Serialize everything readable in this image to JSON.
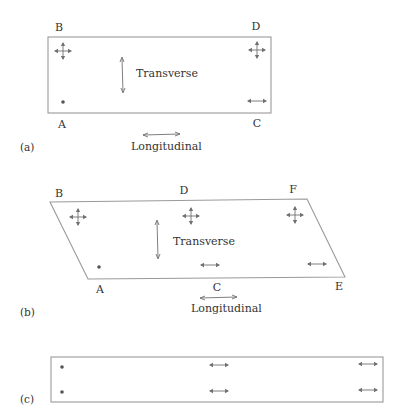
{
  "colors": {
    "outline": "#9a9a9a",
    "arrow": "#707070",
    "text": "#333333",
    "background": "#ffffff"
  },
  "panel_a": {
    "caption": "(a)",
    "corner_labels": {
      "B": "B",
      "D": "D",
      "A": "A",
      "C": "C"
    },
    "transverse_label": "Transverse",
    "longitudinal_label": "Longitudinal",
    "supports": [
      {
        "corner": "B",
        "type": "four-way-arrows"
      },
      {
        "corner": "D",
        "type": "four-way-arrows"
      },
      {
        "corner": "A",
        "type": "fixed-dot"
      },
      {
        "corner": "C",
        "type": "horizontal-arrows"
      }
    ]
  },
  "panel_b": {
    "caption": "(b)",
    "corner_labels": {
      "B": "B",
      "D": "D",
      "F": "F",
      "A": "A",
      "C": "C",
      "E": "E"
    },
    "transverse_label": "Transverse",
    "longitudinal_label": "Longitudinal",
    "supports": [
      {
        "corner": "B",
        "type": "four-way-arrows"
      },
      {
        "corner": "D",
        "type": "four-way-arrows"
      },
      {
        "corner": "F",
        "type": "four-way-arrows"
      },
      {
        "corner": "A",
        "type": "fixed-dot"
      },
      {
        "corner": "C",
        "type": "horizontal-arrows"
      },
      {
        "corner": "E",
        "type": "horizontal-arrows"
      }
    ]
  },
  "panel_c": {
    "caption": "(c)",
    "supports": [
      {
        "position": "left-top",
        "type": "fixed-dot"
      },
      {
        "position": "left-bottom",
        "type": "fixed-dot"
      },
      {
        "position": "middle-top",
        "type": "horizontal-arrows"
      },
      {
        "position": "middle-bottom",
        "type": "horizontal-arrows"
      },
      {
        "position": "right-top",
        "type": "horizontal-arrows"
      },
      {
        "position": "right-bottom",
        "type": "horizontal-arrows"
      }
    ]
  }
}
